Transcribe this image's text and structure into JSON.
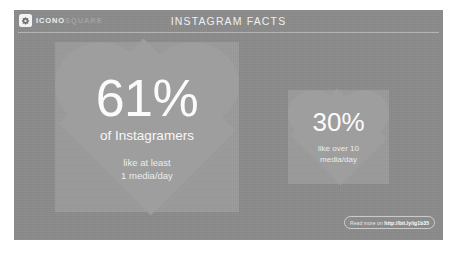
{
  "header": {
    "brand_primary": "ICONO",
    "brand_secondary": "SQUARE",
    "title": "INSTAGRAM FACTS",
    "logo_icon": "iconosquare-logo-icon"
  },
  "stats": {
    "primary": {
      "percent": "61%",
      "label": "of Instagramers",
      "sub_line_1": "like at least",
      "sub_line_2": "1 media/day"
    },
    "secondary": {
      "percent": "30%",
      "sub_line_1": "like over 10",
      "sub_line_2": "media/day"
    }
  },
  "cta": {
    "prefix": "Read more on ",
    "url": "http://bit.ly/ig1b35"
  },
  "colors": {
    "card_background": "#8b8b8b",
    "heart_fill": "#9e9e9e",
    "text": "#ffffff",
    "page_background": "#ffffff"
  }
}
